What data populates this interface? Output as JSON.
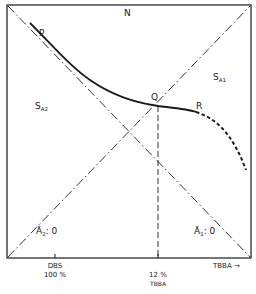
{
  "diagram": {
    "title": "",
    "regions": {
      "N": "N",
      "SA1": {
        "main": "S",
        "sub": "A1"
      },
      "SA2": {
        "main": "S",
        "sub": "A2"
      }
    },
    "points": {
      "P": "P",
      "Q": "Q",
      "R": "R"
    },
    "line_labels": {
      "a2_zero": {
        "text": "Ā",
        "sub": "2",
        "rest": ": 0"
      },
      "a1_zero": {
        "text": "Ā",
        "sub": "1",
        "rest": ": 0"
      }
    },
    "x_axis": {
      "label": "TBBA →",
      "ticks": [
        {
          "line1": "DBS",
          "line2": "100 %"
        },
        {
          "line1": "12 %",
          "line2": "TBBA"
        }
      ]
    },
    "colors": {
      "ink": "#1a1a1a",
      "background": "#ffffff"
    }
  }
}
